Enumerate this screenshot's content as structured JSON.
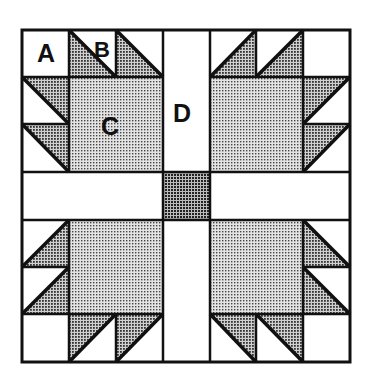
{
  "diagram": {
    "type": "quilt-block",
    "grid": {
      "rows": 7,
      "cols": 7
    },
    "labels": {
      "a": "A",
      "b": "B",
      "c": "C",
      "d": "D"
    },
    "colors": {
      "background": "#ffffff",
      "line": "#111111",
      "light_fill": "#c8c8c8",
      "medium_fill": "#8f8f8f",
      "dark_fill": "#7a7a7a"
    },
    "pieces": {
      "A": "corner square (white)",
      "B": "half-square triangle (shaded/white)",
      "C": "large center square of each paw (light dotted)",
      "D": "sashing strip (white)",
      "center": "small center square (dark dotted)"
    }
  }
}
